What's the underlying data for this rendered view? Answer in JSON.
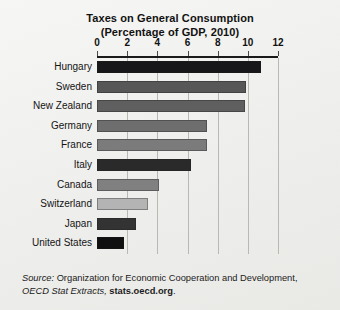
{
  "chart_data": {
    "type": "bar",
    "orientation": "horizontal",
    "title": "Taxes on General Consumption",
    "subtitle": "(Percentage of GDP, 2010)",
    "xlabel": "",
    "ylabel": "",
    "xlim": [
      0,
      12
    ],
    "xticks": [
      0,
      2,
      4,
      6,
      8,
      10,
      12
    ],
    "grid": "vertical",
    "legend": "none",
    "categories": [
      "Hungary",
      "Sweden",
      "New Zealand",
      "Germany",
      "France",
      "Italy",
      "Canada",
      "Switzerland",
      "Japan",
      "United States"
    ],
    "values": [
      10.9,
      9.9,
      9.8,
      7.3,
      7.3,
      6.2,
      4.1,
      3.4,
      2.6,
      1.8
    ],
    "bar_colors": [
      "#17171a",
      "#575757",
      "#5f5f5f",
      "#6e6e6e",
      "#7b7b7b",
      "#2a2a2a",
      "#808080",
      "#b4b4b4",
      "#333333",
      "#101010"
    ],
    "source_prefix": "Source:",
    "source_text": "Organization for Economic Cooperation and Development,",
    "source_publication": "OECD Stat Extracts,",
    "source_url": "stats.oecd.org",
    "source_end": "."
  }
}
